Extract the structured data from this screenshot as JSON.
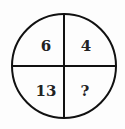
{
  "puzzle": {
    "top_left": "6",
    "top_right": "4",
    "bottom_left": "13",
    "bottom_right": "?"
  }
}
